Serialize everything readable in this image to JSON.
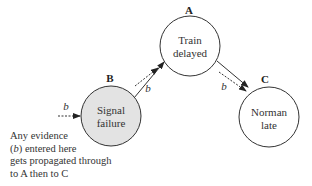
{
  "nodes": {
    "A": {
      "letter": "A",
      "line1": "Train",
      "line2": "delayed",
      "fill": "#ffffff"
    },
    "B": {
      "letter": "B",
      "line1": "Signal",
      "line2": "failure",
      "fill": "#e3e3e3"
    },
    "C": {
      "letter": "C",
      "line1": "Norman",
      "line2": "late",
      "fill": "#ffffff"
    }
  },
  "edges": [
    {
      "from": "B",
      "to": "A"
    },
    {
      "from": "A",
      "to": "C"
    }
  ],
  "evidence_label": "b",
  "note": {
    "line1": "Any evidence",
    "line2_b": "b",
    "line2_rest": " entered here",
    "line3": "gets propagated through",
    "line4": "to A then to C"
  },
  "colors": {
    "stroke": "#333333",
    "shaded_node": "#e3e3e3"
  }
}
